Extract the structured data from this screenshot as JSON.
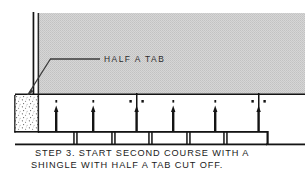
{
  "figure": {
    "background_color": "#ffffff",
    "width": 305,
    "height": 176
  },
  "callout": {
    "label": "HALF  A  TAB",
    "leader_color": "#3a3a3a"
  },
  "caption": {
    "line1": "STEP 3. START SECOND COURSE WITH A",
    "line2": "SHINGLE WITH HALF A TAB CUT OFF.",
    "color": "#1a1a1a"
  },
  "colors": {
    "shingle_fill": "#d2d2d2",
    "outline": "#1a1a1a",
    "stipple": "#555555",
    "white": "#ffffff"
  },
  "geometry": {
    "upper_course_label": "upper shingle course (shaded)",
    "upper_course": {
      "x": 38,
      "y": 13,
      "width": 267,
      "height": 82
    },
    "cut_tab_block_label": "half-tab cut-off block (stippled)",
    "cut_tab_block": {
      "x": 15,
      "y": 95,
      "width": 24,
      "height": 37
    },
    "starter_band_label": "second course starter band",
    "starter_band": {
      "x": 15,
      "y": 95,
      "width": 290,
      "height": 37
    },
    "lower_course_label": "lower shingle course with slots",
    "lower_course": {
      "x": 38,
      "y": 132,
      "width": 267,
      "height": 13
    }
  },
  "nails": {
    "label": "roofing nails",
    "count": 8,
    "positions_x": [
      56,
      93,
      131,
      141,
      173,
      215,
      253,
      263
    ]
  },
  "nail_heads": {
    "label": "nail head dots",
    "count": 8,
    "positions_x": [
      56,
      93,
      131,
      141,
      173,
      215,
      253,
      263
    ]
  },
  "tab_slots_upper": {
    "label": "upper course tab slot cut lines",
    "positions_x": [
      136,
      258
    ]
  },
  "tab_slots_lower": {
    "label": "lower course tab slot lines",
    "positions_x": [
      38,
      74,
      112,
      149,
      187,
      224,
      262,
      299
    ]
  },
  "vertical_edge_lines": {
    "label": "left vertical roof edge lines",
    "positions_x": [
      33,
      39
    ]
  }
}
